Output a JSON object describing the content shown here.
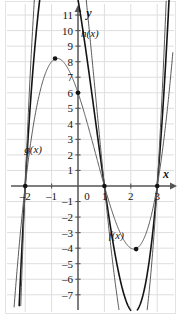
{
  "figure": {
    "type": "graph",
    "axis_x_label": "x",
    "axis_y_label": "y"
  },
  "chart_data": {
    "type": "line",
    "title": "",
    "xlabel": "x",
    "ylabel": "y",
    "xlim": [
      -2.6,
      3.6
    ],
    "ylim": [
      -7.6,
      12.0
    ],
    "grid": true,
    "legend": "inline-labels",
    "xticks": [
      -2,
      -1,
      0,
      1,
      2,
      3
    ],
    "xtick_labels": [
      "–2",
      "–1",
      "0",
      "1",
      "2",
      "3"
    ],
    "yticks": [
      11,
      10,
      9,
      8,
      7,
      6,
      5,
      4,
      3,
      2,
      1,
      -1,
      -2,
      -3,
      -4,
      -5,
      -6,
      -7
    ],
    "ytick_labels": [
      "11",
      "10",
      "9",
      "8",
      "7",
      "6",
      "5",
      "4",
      "3",
      "2",
      "1",
      "–1",
      "–2",
      "–3",
      "–4",
      "–5",
      "–6",
      "–7"
    ],
    "series": [
      {
        "name": "f(x)",
        "label": "f(x)",
        "color": "#141414",
        "width": 1.6,
        "roots": [
          -2,
          1,
          3
        ],
        "cubic": "f(x) = 2(x+2)(x-1)(x-3)",
        "leading_coeff": 2,
        "y_intercept": 6,
        "local_max": [
          -0.8685,
          8.2088
        ],
        "local_min": [
          2.2019,
          -4.0607
        ],
        "marked_points": [
          {
            "x": -2,
            "y": 0
          },
          {
            "x": 1,
            "y": 0
          },
          {
            "x": 3,
            "y": 0
          },
          {
            "x": 0,
            "y": 6
          },
          {
            "x": -0.8685,
            "y": 8.2088
          },
          {
            "x": 2.2019,
            "y": -4.0607
          }
        ]
      },
      {
        "name": "g(x)",
        "label": "g(x)",
        "color": "#5a5a5a",
        "width": 1.0,
        "roots": [
          -2,
          1,
          3
        ],
        "cubic": "g(x) = (x+2)(x-1)(x-3)",
        "leading_coeff": 1,
        "y_intercept": 3,
        "local_max": [
          -0.8685,
          4.1044
        ],
        "local_min": [
          2.2019,
          -2.0303
        ],
        "marked_points": []
      },
      {
        "name": "h(x)",
        "label": "h(x)",
        "color": "#5a5a5a",
        "width": 1.0,
        "roots": [
          -2,
          1,
          3
        ],
        "cubic": "h(x) = 2.8(x+2)(x-1)(x-3)",
        "leading_coeff": 2.8,
        "y_intercept": 8.4,
        "local_max": [
          -0.8685,
          11.4923
        ],
        "local_min": [
          2.2019,
          -5.685
        ],
        "marked_points": []
      }
    ],
    "curve_labels": [
      {
        "text": "h(x)",
        "x": 0.45,
        "y": 9.6
      },
      {
        "text": "g(x)",
        "x": -1.7,
        "y": 2.1
      },
      {
        "text": "f(x)",
        "x": 1.45,
        "y": -3.4
      }
    ]
  },
  "axes": {
    "x_axis_tip": "x",
    "y_axis_tip": "y"
  },
  "style": {
    "grid_color": "#dedede",
    "axis_color": "#555555",
    "background": "#ffffff",
    "curve_dark": "#141414",
    "curve_light": "#5a5a5a",
    "text_color": "#141414"
  }
}
